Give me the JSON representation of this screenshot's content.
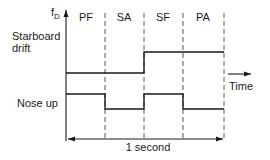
{
  "diagram": {
    "y_axis_label": "f",
    "y_axis_label_sub": "D",
    "x_axis_label": "Time",
    "phases": [
      {
        "label": "PF"
      },
      {
        "label": "SA"
      },
      {
        "label": "SF"
      },
      {
        "label": "PA"
      }
    ],
    "signals": [
      {
        "name": "Starboard drift",
        "line1": "Starboard",
        "line2": "drift",
        "levels": [
          "low",
          "low",
          "high",
          "high"
        ]
      },
      {
        "name": "Nose up",
        "line1": "Nose up",
        "levels": [
          "high",
          "low",
          "high",
          "low"
        ]
      }
    ],
    "duration_label": "1 second",
    "colors": {
      "ink": "#1a1a1a",
      "background": "#ffffff"
    }
  }
}
